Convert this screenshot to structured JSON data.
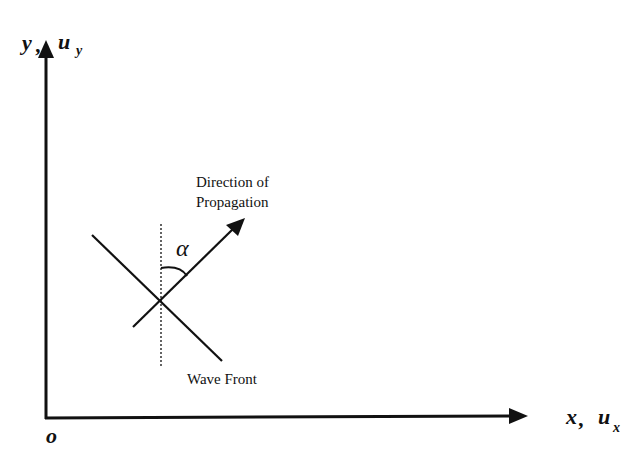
{
  "diagram": {
    "type": "wave-propagation-coordinate-diagram",
    "colors": {
      "ink": "#111111",
      "background": "#ffffff"
    },
    "axes": {
      "y_label": {
        "main": "y",
        "sep": ",",
        "u": "u",
        "sub": "y"
      },
      "x_label": {
        "main": "x",
        "sep": ",",
        "u": "u",
        "sub": "x"
      },
      "origin_label": "o"
    },
    "annotations": {
      "direction_line1": "Direction of",
      "direction_line2": "Propagation",
      "angle_symbol": "α",
      "wave_front": "Wave Front"
    }
  }
}
